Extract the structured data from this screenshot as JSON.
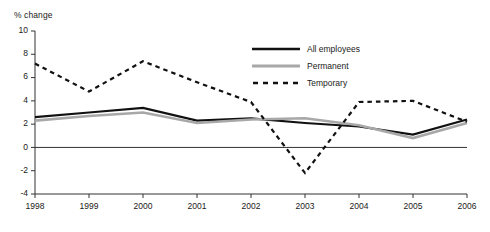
{
  "chart_data": {
    "type": "line",
    "title": "",
    "ylabel": "% change",
    "xlabel": "",
    "categories": [
      "1998",
      "1999",
      "2000",
      "2001",
      "2002",
      "2003",
      "2004",
      "2005",
      "2006"
    ],
    "x": [
      1998,
      1999,
      2000,
      2001,
      2002,
      2003,
      2004,
      2005,
      2006
    ],
    "ylim": [
      -4,
      10
    ],
    "xlim": [
      1998,
      2006
    ],
    "yticks": [
      10,
      8,
      6,
      4,
      2,
      0,
      -2,
      -4
    ],
    "grid": false,
    "zero_line": true,
    "legend_position": "top-right",
    "series": [
      {
        "name": "All employees",
        "color": "#111111",
        "style": "solid",
        "width": 2.2,
        "values": [
          2.6,
          3.0,
          3.4,
          2.3,
          2.5,
          2.1,
          1.8,
          1.1,
          2.4
        ]
      },
      {
        "name": "Permanent",
        "color": "#a8a8a8",
        "style": "solid",
        "width": 2.6,
        "values": [
          2.3,
          2.7,
          3.0,
          2.1,
          2.4,
          2.5,
          1.9,
          0.8,
          2.1
        ]
      },
      {
        "name": "Temporary",
        "color": "#111111",
        "style": "dashed",
        "width": 2.2,
        "values": [
          7.2,
          4.8,
          7.4,
          5.6,
          3.9,
          -2.2,
          3.9,
          4.0,
          2.2
        ]
      }
    ]
  },
  "axis": {
    "y_title": "% change",
    "y_tick_labels": [
      "10",
      "8",
      "6",
      "4",
      "2",
      "0",
      "-2",
      "-4"
    ],
    "x_tick_labels": [
      "1998",
      "1999",
      "2000",
      "2001",
      "2002",
      "2003",
      "2004",
      "2005",
      "2006"
    ]
  },
  "legend": {
    "items": [
      {
        "label": "All employees",
        "icon": "solid-line-black-icon"
      },
      {
        "label": "Permanent",
        "icon": "solid-line-gray-icon"
      },
      {
        "label": "Temporary",
        "icon": "dashed-line-black-icon"
      }
    ]
  }
}
